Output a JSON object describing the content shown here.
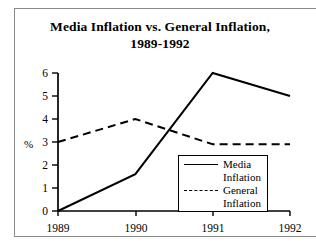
{
  "chart_data": {
    "type": "line",
    "title": "Media Inflation vs. General Inflation, 1989-1992",
    "title_line1": "Media Inflation vs. General Inflation,",
    "title_line2": "1989-1992",
    "xlabel": "",
    "ylabel": "%",
    "categories": [
      "1989",
      "1990",
      "1991",
      "1992"
    ],
    "x": [
      1989,
      1990,
      1991,
      1992
    ],
    "ylim": [
      0,
      6
    ],
    "yticks": [
      "0",
      "1",
      "2",
      "3",
      "4",
      "5",
      "6"
    ],
    "ytick_values": [
      0,
      1,
      2,
      3,
      4,
      5,
      6
    ],
    "grid": false,
    "legend_position": "lower-right-inside",
    "series": [
      {
        "name": "Media Inflation",
        "name_line1": "Media",
        "name_line2": "Inflation",
        "style": "solid",
        "color": "#000000",
        "values": [
          0,
          1.6,
          6,
          5
        ]
      },
      {
        "name": "General Inflation",
        "name_line1": "General",
        "name_line2": "Inflation",
        "style": "dashed",
        "color": "#000000",
        "values": [
          3.0,
          4.0,
          2.9,
          2.9
        ]
      }
    ]
  },
  "axis": {
    "unit_label": "%",
    "ytick_0": "0",
    "ytick_1": "1",
    "ytick_2": "2",
    "ytick_3": "3",
    "ytick_4": "4",
    "ytick_5": "5",
    "ytick_6": "6",
    "xtick_0": "1989",
    "xtick_1": "1990",
    "xtick_2": "1991",
    "xtick_3": "1992"
  },
  "legend": {
    "item_media_line1": "Media",
    "item_media_line2": "Inflation",
    "item_general_line1": "General",
    "item_general_line2": "Inflation"
  }
}
